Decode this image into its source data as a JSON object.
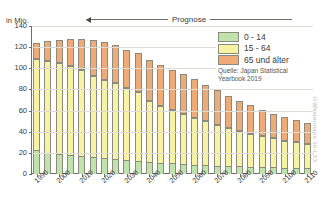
{
  "chart_data": {
    "type": "bar",
    "stacked": true,
    "title": "",
    "subtitle": "",
    "xlabel": "",
    "ylabel": "in Mio.",
    "ylim": [
      0,
      140
    ],
    "yticks": [
      0,
      20,
      40,
      60,
      80,
      100,
      120,
      140
    ],
    "grid": true,
    "legend_position": "top-right",
    "categories": [
      "1990",
      "1995",
      "2000",
      "2005",
      "2010",
      "2015",
      "2020",
      "2025",
      "2030",
      "2035",
      "2040",
      "2045",
      "2050",
      "2055",
      "2060",
      "2065",
      "2070",
      "2075",
      "2080",
      "2085",
      "2090",
      "2095",
      "2100",
      "2105",
      "2110"
    ],
    "xtick_labels": [
      "1990",
      "2000",
      "2010",
      "2020",
      "2030",
      "2040",
      "2050",
      "2060",
      "2070",
      "2080",
      "2090",
      "2100",
      "2110"
    ],
    "xtick_indices": [
      0,
      2,
      4,
      6,
      8,
      10,
      12,
      14,
      16,
      18,
      20,
      22,
      24
    ],
    "series": [
      {
        "name": "0 - 14",
        "color": "#bfe3ab",
        "values": [
          22.5,
          20.0,
          18.5,
          17.6,
          16.8,
          15.9,
          15.1,
          14.1,
          13.2,
          12.4,
          11.4,
          10.6,
          10.0,
          9.4,
          8.9,
          8.4,
          8.0,
          7.6,
          7.2,
          6.9,
          6.6,
          6.3,
          6.0,
          5.8,
          5.6
        ]
      },
      {
        "name": "15 - 64",
        "color": "#f7f3a3",
        "values": [
          86.1,
          87.2,
          86.2,
          84.4,
          81.3,
          77.3,
          74.1,
          71.7,
          67.7,
          64.9,
          58.0,
          54.1,
          50.3,
          47.1,
          44.2,
          41.3,
          38.5,
          35.9,
          33.4,
          31.2,
          29.2,
          27.4,
          25.7,
          24.2,
          22.8
        ]
      },
      {
        "name": "65 und älter",
        "color": "#efab75",
        "values": [
          14.9,
          18.3,
          22.0,
          25.7,
          29.5,
          33.9,
          36.0,
          36.6,
          36.8,
          37.4,
          38.7,
          38.6,
          38.4,
          38.0,
          36.4,
          34.6,
          32.7,
          30.6,
          28.6,
          26.8,
          25.0,
          23.5,
          22.1,
          20.9,
          19.8
        ]
      }
    ],
    "totals": [
      123.5,
      125.5,
      126.7,
      127.7,
      127.6,
      127.1,
      125.2,
      122.4,
      117.7,
      114.7,
      108.1,
      103.3,
      98.7,
      94.5,
      89.5,
      84.3,
      79.2,
      74.1,
      69.2,
      64.9,
      60.8,
      57.2,
      53.8,
      50.9,
      48.2
    ],
    "annotations": [
      {
        "name": "prognose",
        "label": "Prognose",
        "from_year": "2020",
        "to_year": "2110"
      }
    ]
  },
  "axis": {
    "unit_label": "in Mio.",
    "y_ticks": [
      "0",
      "20",
      "40",
      "60",
      "80",
      "100",
      "120",
      "140"
    ]
  },
  "prognose": {
    "label": "Prognose"
  },
  "legend": {
    "items": [
      {
        "label": "0 - 14",
        "color": "#bfe3ab"
      },
      {
        "label": "15 - 64",
        "color": "#f7f3a3"
      },
      {
        "label": "65 und älter",
        "color": "#efab75"
      }
    ],
    "source": "Quelle: Japan Statistical Yearbook 2019"
  },
  "watermark": {
    "text": "©Westermann  36-LXX"
  }
}
